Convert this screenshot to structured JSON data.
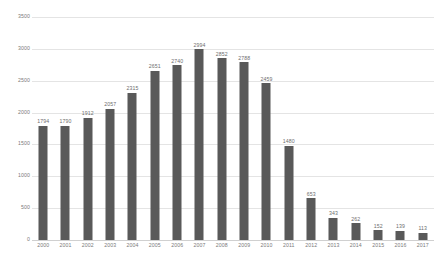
{
  "chart_data": {
    "type": "bar",
    "title": "",
    "subtitle": "",
    "xlabel": "",
    "ylabel": "",
    "categories": [
      "2000",
      "2001",
      "2002",
      "2003",
      "2004",
      "2005",
      "2006",
      "2007",
      "2008",
      "2009",
      "2010",
      "2011",
      "2012",
      "2013",
      "2014",
      "2015",
      "2016",
      "2017"
    ],
    "values": [
      1794,
      1790,
      1912,
      2057,
      2315,
      2651,
      2740,
      2994,
      2852,
      2788,
      2459,
      1480,
      653,
      343,
      262,
      152,
      139,
      113
    ],
    "data_labels": [
      "1794",
      "1790",
      "1912",
      "2057",
      "2315",
      "2651",
      "2740",
      "2994",
      "2852",
      "2788",
      "2459",
      "1480",
      "653",
      "343",
      "262",
      "152",
      "139",
      "113"
    ],
    "ylim": [
      0,
      3500
    ],
    "y_ticks": [
      0,
      500,
      1000,
      1500,
      2000,
      2500,
      3000,
      3500
    ],
    "y_tick_labels": [
      "0",
      "500",
      "1000",
      "1500",
      "2000",
      "2500",
      "3000",
      "3500"
    ],
    "grid": true,
    "grid_axis": "y",
    "legend": false,
    "legend_position": "none",
    "series": [
      {
        "name": "",
        "values": [
          1794,
          1790,
          1912,
          2057,
          2315,
          2651,
          2740,
          2994,
          2852,
          2788,
          2459,
          1480,
          653,
          343,
          262,
          152,
          139,
          113
        ]
      }
    ]
  },
  "style": {
    "bar_color": "#595959",
    "grid_color": "#e4e4e4",
    "axis_color": "#d0d0d0",
    "label_color": "#7a7a7a",
    "value_label_color": "#6e6e6e",
    "background": "#ffffff"
  }
}
